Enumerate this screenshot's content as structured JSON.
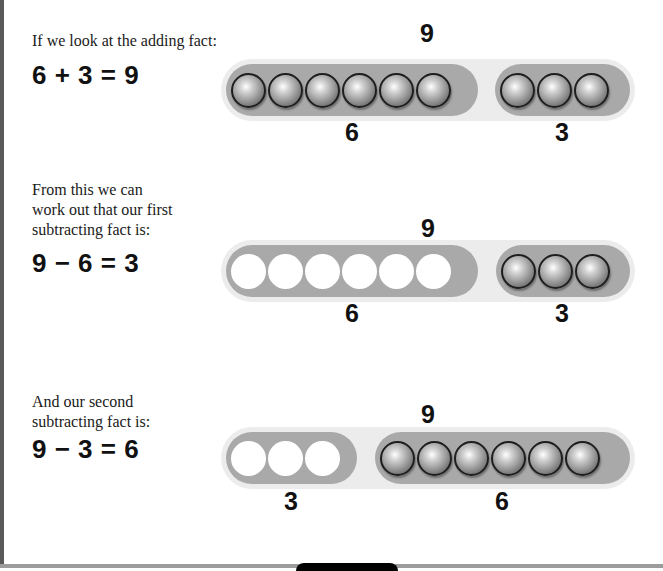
{
  "rows": [
    {
      "caption": [
        "If we look at the adding fact:"
      ],
      "equation": "6 + 3 = 9",
      "total_label": "9",
      "groups": [
        {
          "count": 6,
          "filled": true,
          "label": "6"
        },
        {
          "count": 3,
          "filled": true,
          "label": "3"
        }
      ]
    },
    {
      "caption": [
        "From this we can",
        "work out that our first",
        "subtracting fact is:"
      ],
      "equation": "9 − 6 = 3",
      "total_label": "9",
      "groups": [
        {
          "count": 6,
          "filled": false,
          "label": "6"
        },
        {
          "count": 3,
          "filled": true,
          "label": "3"
        }
      ]
    },
    {
      "caption": [
        "And our second",
        "subtracting fact is:"
      ],
      "equation": "9 − 3 = 6",
      "total_label": "9",
      "groups": [
        {
          "count": 3,
          "filled": false,
          "label": "3"
        },
        {
          "count": 6,
          "filled": true,
          "label": "6"
        }
      ]
    }
  ],
  "colors": {
    "bar": "#a9a9a9",
    "halo": "#ececec",
    "left_strip": "#5a5a5a"
  }
}
